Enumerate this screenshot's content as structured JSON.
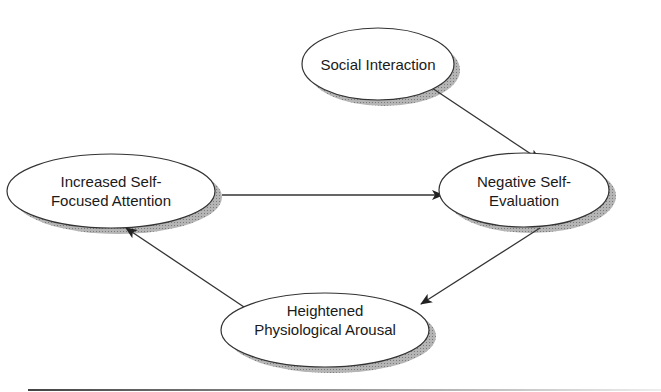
{
  "diagram": {
    "type": "flow-cycle",
    "nodes": [
      {
        "id": "social",
        "lines": [
          "Social Interaction"
        ]
      },
      {
        "id": "attention",
        "lines": [
          "Increased Self-",
          "Focused Attention"
        ]
      },
      {
        "id": "evaluation",
        "lines": [
          "Negative Self-",
          "Evaluation"
        ]
      },
      {
        "id": "arousal",
        "lines": [
          "Heightened",
          "Physiological Arousal"
        ]
      }
    ],
    "edges": [
      {
        "from": "Social Interaction",
        "to": "Negative Self-Evaluation"
      },
      {
        "from": "Increased Self-Focused Attention",
        "to": "Negative Self-Evaluation"
      },
      {
        "from": "Negative Self-Evaluation",
        "to": "Heightened Physiological Arousal"
      },
      {
        "from": "Heightened Physiological Arousal",
        "to": "Increased Self-Focused Attention"
      }
    ],
    "colors": {
      "stroke": "#333333",
      "shadow": "#9a9a9a",
      "fill": "#ffffff"
    }
  }
}
